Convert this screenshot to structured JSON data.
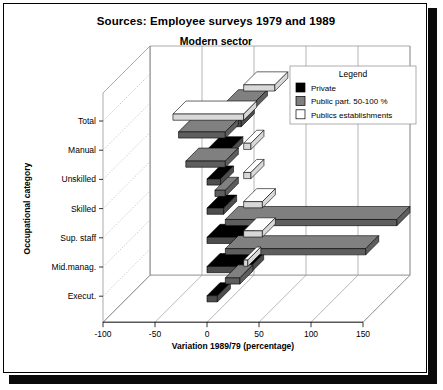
{
  "titles": {
    "main": "Sources: Employee surveys 1979 and 1989",
    "sub": "Modern sector"
  },
  "legend": {
    "title": "Legend",
    "entries": [
      {
        "label": "Private",
        "color": "#000000"
      },
      {
        "label": "Public part. 50-100 %",
        "color": "#808080"
      },
      {
        "label": "Publics establishments",
        "color": "#ffffff"
      }
    ]
  },
  "axes": {
    "ylabel": "Occupational category",
    "xlabel": "Variation 1989/79 (percentage)",
    "xticks": [
      "-100",
      "-50",
      "0",
      "50",
      "100",
      "150"
    ],
    "xtickvalues": [
      -100,
      -50,
      0,
      50,
      100,
      150
    ],
    "ycats": [
      "Total",
      "Manual",
      "Unskilled",
      "Skilled",
      "Sup. staff",
      "Mid.manag.",
      "Execut."
    ]
  },
  "chart_data": {
    "type": "bar",
    "orientation": "horizontal",
    "threeD": true,
    "title": "Sources: Employee surveys 1979 and 1989",
    "subtitle": "Modern sector",
    "xlabel": "Variation 1989/79 (percentage)",
    "ylabel": "Occupational category",
    "xlim": [
      -100,
      150
    ],
    "xticks": [
      -100,
      -50,
      0,
      50,
      100,
      150
    ],
    "grid": true,
    "legend_position": "top-right",
    "categories": [
      "Total",
      "Manual",
      "Unskilled",
      "Skilled",
      "Sup. staff",
      "Mid.manag.",
      "Execut."
    ],
    "series": [
      {
        "name": "Private",
        "color": "#000000",
        "values": [
          33,
          22,
          13,
          16,
          33,
          42,
          10
        ]
      },
      {
        "name": "Public part. 50-100 %",
        "color": "#808080",
        "values": [
          28,
          -45,
          -38,
          -10,
          165,
          135,
          14
        ]
      },
      {
        "name": "Publics establishments",
        "color": "#ffffff",
        "values": [
          30,
          -68,
          7,
          7,
          18,
          18,
          4
        ]
      }
    ]
  }
}
